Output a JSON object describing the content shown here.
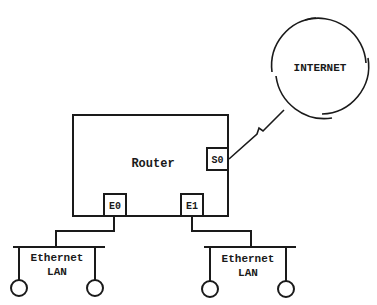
{
  "diagram": {
    "type": "network-topology",
    "nodes": {
      "internet": {
        "label": "INTERNET",
        "shape": "cloud-circle"
      },
      "router": {
        "label": "Router",
        "shape": "rectangle"
      },
      "interfaces": [
        {
          "id": "S0",
          "label": "S0",
          "type": "serial"
        },
        {
          "id": "E0",
          "label": "E0",
          "type": "ethernet"
        },
        {
          "id": "E1",
          "label": "E1",
          "type": "ethernet"
        }
      ],
      "lans": [
        {
          "id": "lan-left",
          "line1": "Ethernet",
          "line2": "LAN",
          "hosts": 2
        },
        {
          "id": "lan-right",
          "line1": "Ethernet",
          "line2": "LAN",
          "hosts": 2
        }
      ]
    },
    "edges": [
      {
        "from": "S0",
        "to": "internet",
        "style": "serial-zigzag"
      },
      {
        "from": "E0",
        "to": "lan-left",
        "style": "straight"
      },
      {
        "from": "E1",
        "to": "lan-right",
        "style": "straight"
      }
    ],
    "colors": {
      "stroke": "#1a1a1a",
      "background": "#ffffff"
    }
  }
}
